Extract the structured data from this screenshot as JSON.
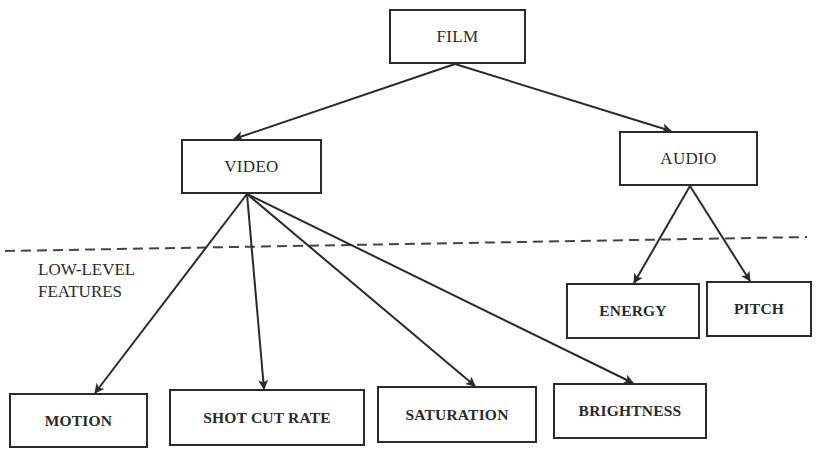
{
  "diagram": {
    "type": "hierarchy-tree",
    "root": {
      "id": "film",
      "label": "FILM"
    },
    "nodes": [
      {
        "id": "film",
        "label": "FILM",
        "level": "high",
        "box": [
          389,
          9,
          137,
          55
        ]
      },
      {
        "id": "video",
        "label": "VIDEO",
        "level": "high",
        "box": [
          181,
          139,
          141,
          55
        ]
      },
      {
        "id": "audio",
        "label": "AUDIO",
        "level": "high",
        "box": [
          619,
          131,
          139,
          55
        ]
      },
      {
        "id": "energy",
        "label": "ENERGY",
        "level": "low",
        "box": [
          566,
          283,
          134,
          56
        ]
      },
      {
        "id": "pitch",
        "label": "PITCH",
        "level": "low",
        "box": [
          706,
          281,
          106,
          56
        ]
      },
      {
        "id": "motion",
        "label": "MOTION",
        "level": "low",
        "box": [
          9,
          393,
          139,
          55
        ]
      },
      {
        "id": "shot_cut_rate",
        "label": "SHOT CUT RATE",
        "level": "low",
        "box": [
          169,
          389,
          196,
          57
        ]
      },
      {
        "id": "saturation",
        "label": "SATURATION",
        "level": "low",
        "box": [
          377,
          386,
          160,
          57
        ]
      },
      {
        "id": "brightness",
        "label": "BRIGHTNESS",
        "level": "low",
        "box": [
          553,
          383,
          154,
          56
        ]
      }
    ],
    "edges": [
      {
        "from": "film",
        "to": "video",
        "start": [
          455,
          64
        ],
        "end": [
          234,
          139
        ]
      },
      {
        "from": "film",
        "to": "audio",
        "start": [
          455,
          64
        ],
        "end": [
          671,
          131
        ]
      },
      {
        "from": "video",
        "to": "motion",
        "start": [
          247,
          194
        ],
        "end": [
          95,
          393
        ]
      },
      {
        "from": "video",
        "to": "shot_cut_rate",
        "start": [
          247,
          194
        ],
        "end": [
          264,
          389
        ]
      },
      {
        "from": "video",
        "to": "saturation",
        "start": [
          247,
          194
        ],
        "end": [
          475,
          386
        ]
      },
      {
        "from": "video",
        "to": "brightness",
        "start": [
          247,
          194
        ],
        "end": [
          633,
          383
        ]
      },
      {
        "from": "audio",
        "to": "energy",
        "start": [
          690,
          186
        ],
        "end": [
          634,
          283
        ]
      },
      {
        "from": "audio",
        "to": "pitch",
        "start": [
          690,
          186
        ],
        "end": [
          750,
          281
        ]
      }
    ],
    "separator": {
      "style": "dashed",
      "start": [
        5,
        251
      ],
      "end": [
        807,
        237
      ],
      "label_lines": [
        "LOW-LEVEL",
        "FEATURES"
      ]
    },
    "colors": {
      "stroke": "#2a2a2a",
      "separator": "#444444",
      "background": "#ffffff"
    }
  }
}
